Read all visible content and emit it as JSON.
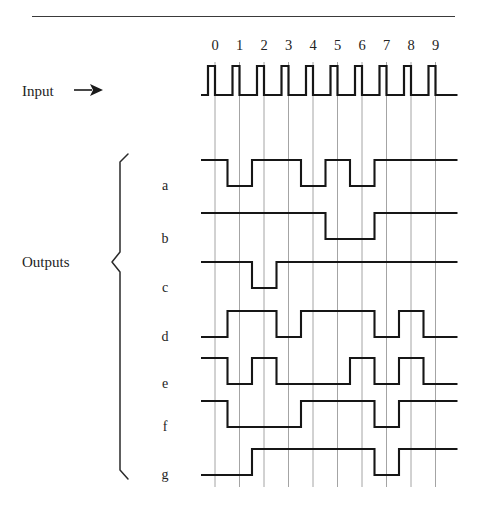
{
  "figure": {
    "title_rule": "horizontal-rule",
    "input_label": "Input",
    "outputs_label": "Outputs",
    "column_headers": [
      "0",
      "1",
      "2",
      "3",
      "4",
      "5",
      "6",
      "7",
      "8",
      "9"
    ],
    "row_labels": [
      "a",
      "b",
      "c",
      "d",
      "e",
      "f",
      "g"
    ],
    "colors": {
      "waveform": "#161616",
      "gridline": "#9a9a9a",
      "rule": "#3a3a3a",
      "text": "#232323",
      "background": "#ffffff"
    }
  },
  "chart_data": {
    "type": "line",
    "title": "",
    "xlabel": "",
    "ylabel": "",
    "grid": true,
    "legend_position": "left",
    "x": [
      0,
      1,
      2,
      3,
      4,
      5,
      6,
      7,
      8,
      9
    ],
    "categories": [
      "0",
      "1",
      "2",
      "3",
      "4",
      "5",
      "6",
      "7",
      "8",
      "9"
    ],
    "clock": {
      "name": "Input",
      "description": "clock pulse train, one narrow positive pulse per digit",
      "pulse_count": 10,
      "values": [
        1,
        1,
        1,
        1,
        1,
        1,
        1,
        1,
        1,
        1
      ]
    },
    "series": [
      {
        "name": "a",
        "values": [
          1,
          0,
          1,
          1,
          0,
          1,
          0,
          1,
          1,
          1
        ]
      },
      {
        "name": "b",
        "values": [
          1,
          1,
          1,
          1,
          1,
          0,
          0,
          1,
          1,
          1
        ]
      },
      {
        "name": "c",
        "values": [
          1,
          1,
          0,
          1,
          1,
          1,
          1,
          1,
          1,
          1
        ]
      },
      {
        "name": "d",
        "values": [
          0,
          1,
          1,
          0,
          1,
          1,
          1,
          0,
          1,
          0
        ]
      },
      {
        "name": "e",
        "values": [
          1,
          0,
          1,
          0,
          0,
          0,
          1,
          0,
          1,
          0
        ]
      },
      {
        "name": "f",
        "values": [
          1,
          0,
          0,
          0,
          1,
          1,
          1,
          0,
          1,
          1
        ]
      },
      {
        "name": "g",
        "values": [
          0,
          0,
          1,
          1,
          1,
          1,
          1,
          0,
          1,
          1
        ]
      }
    ],
    "ylim": [
      0,
      1
    ],
    "annotations": []
  },
  "geometry": {
    "grid_x_start": 215,
    "grid_step": 24.5,
    "grid_top": 62,
    "grid_bottom": 487,
    "wave_tail": 22,
    "clock_baseline": 95,
    "clock_peak": 66,
    "row_tops": [
      160,
      213,
      262,
      311,
      358,
      401,
      449
    ],
    "row_amplitude": 26
  }
}
